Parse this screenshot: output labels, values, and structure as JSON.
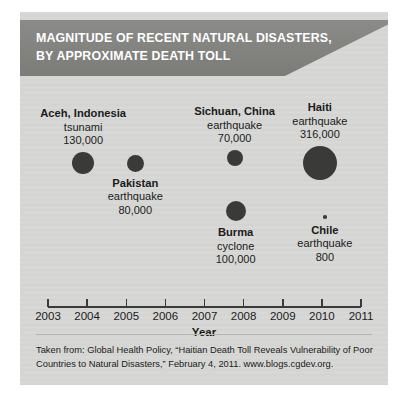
{
  "banner": {
    "title_line1": "MAGNITUDE OF RECENT NATURAL DISASTERS,",
    "title_line2": "BY APPROXIMATE DEATH TOLL",
    "background_color": "#82827f",
    "text_color": "#ffffff"
  },
  "panel": {
    "background_color": "#d6d6d4",
    "bubble_color": "#3a3a38"
  },
  "chart_data": {
    "type": "scatter",
    "title": "MAGNITUDE OF RECENT NATURAL DISASTERS, BY APPROXIMATE DEATH TOLL",
    "xlabel": "Year",
    "ylabel": "",
    "xlim": [
      2003,
      2011
    ],
    "tick_labels": [
      "2003",
      "2004",
      "2005",
      "2006",
      "2007",
      "2008",
      "2009",
      "2010",
      "2011"
    ],
    "grid": false,
    "legend": "none",
    "size_encodes": "approximate death toll",
    "points": [
      {
        "place": "Aceh, Indonesia",
        "kind": "tsunami",
        "toll_label": "130,000",
        "toll": 130000,
        "year": 2004,
        "label_position": "above"
      },
      {
        "place": "Pakistan",
        "kind": "earthquake",
        "toll_label": "80,000",
        "toll": 80000,
        "year": 2005,
        "label_position": "below"
      },
      {
        "place": "Sichuan, China",
        "kind": "earthquake",
        "toll_label": "70,000",
        "toll": 70000,
        "year": 2008,
        "label_position": "above"
      },
      {
        "place": "Burma",
        "kind": "cyclone",
        "toll_label": "100,000",
        "toll": 100000,
        "year": 2008,
        "label_position": "below"
      },
      {
        "place": "Haiti",
        "kind": "earthquake",
        "toll_label": "316,000",
        "toll": 316000,
        "year": 2010,
        "label_position": "above"
      },
      {
        "place": "Chile",
        "kind": "earthquake",
        "toll_label": "800",
        "toll": 800,
        "year": 2010,
        "label_position": "below"
      }
    ]
  },
  "footer": {
    "line1": "Taken from: Global Health Policy, “Haitian Death Toll Reveals Vulnerability of Poor",
    "line2": "Countries to Natural Disasters,” February 4, 2011. www.blogs.cgdev.org."
  }
}
